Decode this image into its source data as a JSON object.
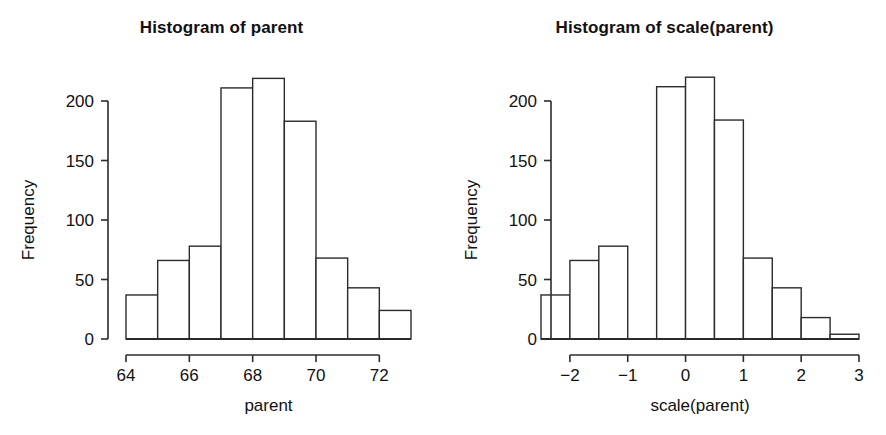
{
  "figure": {
    "background": "#ffffff",
    "ink_color": "#2b2b2b",
    "panel_count": 2
  },
  "panels": [
    {
      "id": "left",
      "title": "Histogram of parent",
      "xlabel": "parent",
      "ylabel": "Frequency"
    },
    {
      "id": "right",
      "title": "Histogram of scale(parent)",
      "xlabel": "scale(parent)",
      "ylabel": "Frequency"
    }
  ],
  "chart_data": [
    {
      "type": "bar",
      "subtype": "histogram",
      "title": "Histogram of parent",
      "xlabel": "parent",
      "ylabel": "Frequency",
      "xlim": [
        64,
        73
      ],
      "ylim": [
        0,
        225
      ],
      "grid": false,
      "legend": "none",
      "bin_width": 1,
      "bin_edges": [
        64,
        65,
        66,
        67,
        68,
        69,
        70,
        71,
        72,
        73
      ],
      "categories": [
        "64-65",
        "65-66",
        "66-67",
        "67-68",
        "68-69",
        "69-70",
        "70-71",
        "71-72",
        "72-73"
      ],
      "values": [
        37,
        66,
        78,
        211,
        219,
        183,
        68,
        43,
        24
      ],
      "xticks": [
        64,
        66,
        68,
        70,
        72
      ],
      "xticklabels": [
        "64",
        "66",
        "68",
        "70",
        "72"
      ],
      "yticks": [
        0,
        50,
        100,
        150,
        200
      ],
      "yticklabels": [
        "0",
        "50",
        "100",
        "150",
        "200"
      ]
    },
    {
      "type": "bar",
      "subtype": "histogram",
      "title": "Histogram of scale(parent)",
      "xlabel": "scale(parent)",
      "ylabel": "Frequency",
      "xlim": [
        -2.5,
        3.0
      ],
      "ylim": [
        0,
        225
      ],
      "grid": false,
      "legend": "none",
      "bin_width": 0.5,
      "bin_edges": [
        -2.5,
        -2.0,
        -1.5,
        -1.0,
        -0.5,
        0.0,
        0.5,
        1.0,
        1.5,
        2.0,
        2.5,
        3.0
      ],
      "categories": [
        "-2.5 to -2.0",
        "-2.0 to -1.5",
        "-1.5 to -1.0",
        "-1.0 to -0.5",
        "-0.5 to 0.0",
        "0.0 to 0.5",
        "0.5 to 1.0",
        "1.0 to 1.5",
        "1.5 to 2.0",
        "2.0 to 2.5",
        "2.5 to 3.0"
      ],
      "values": [
        37,
        66,
        78,
        0,
        212,
        220,
        184,
        68,
        43,
        18,
        4
      ],
      "xticks": [
        -2,
        -1,
        0,
        1,
        2,
        3
      ],
      "xticklabels": [
        "−2",
        "−1",
        "0",
        "1",
        "2",
        "3"
      ],
      "yticks": [
        0,
        50,
        100,
        150,
        200
      ],
      "yticklabels": [
        "0",
        "50",
        "100",
        "150",
        "200"
      ]
    }
  ]
}
